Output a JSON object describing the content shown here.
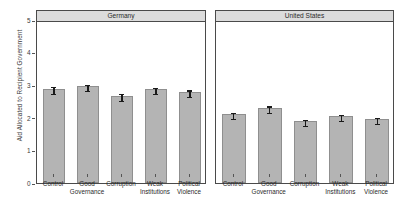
{
  "chart_data": {
    "type": "bar",
    "title": "",
    "xlabel": "",
    "ylabel": "Aid Allocated to Recipient Government",
    "ylim": [
      0,
      5
    ],
    "yticks": [
      0,
      1,
      2,
      3,
      4,
      5
    ],
    "ytick_labels": [
      "0",
      "1",
      "2",
      "3",
      "4",
      "5"
    ],
    "grid": false,
    "legend": null,
    "categories": [
      "Control",
      "Good Governance",
      "Corruption",
      "Weak Institutions",
      "Political Violence"
    ],
    "category_lines": [
      {
        "line1": "Control",
        "line2": ""
      },
      {
        "line1": "Good",
        "line2": "Governance"
      },
      {
        "line1": "Corruption",
        "line2": ""
      },
      {
        "line1": "Weak",
        "line2": "Institutions"
      },
      {
        "line1": "Political",
        "line2": "Violence"
      }
    ],
    "panels": [
      {
        "name": "Germany",
        "values": [
          2.89,
          2.98,
          2.68,
          2.89,
          2.8
        ],
        "err_low": [
          2.78,
          2.88,
          2.58,
          2.79,
          2.7
        ],
        "err_high": [
          3.0,
          3.08,
          2.78,
          2.99,
          2.9
        ]
      },
      {
        "name": "United States",
        "values": [
          2.12,
          2.31,
          1.91,
          2.06,
          1.97
        ],
        "err_low": [
          2.02,
          2.21,
          1.82,
          1.96,
          1.88
        ],
        "err_high": [
          2.22,
          2.41,
          2.0,
          2.16,
          2.06
        ]
      }
    ],
    "colors": {
      "bar_fill": "#b4b4b4",
      "bar_edge": "#8f8f8f",
      "error_bar": "#1a1a1a",
      "panel_strip": "#dcdcdc",
      "panel_border": "#4a4a4a",
      "plot_background": "#ffffff",
      "text": "#2b2b2b"
    }
  }
}
